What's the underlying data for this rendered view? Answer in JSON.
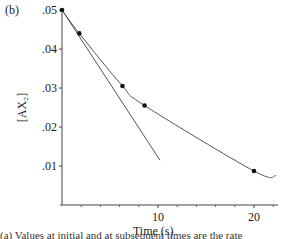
{
  "panel_label": "(b)",
  "bottom_text_fragment": "(a) Values at initial and at subsequent times are the rate",
  "chart_data": {
    "type": "line",
    "title": "",
    "xlabel": "Time (s)",
    "ylabel": "[AX2]",
    "ylabel_display": "[AX₂]",
    "xlim": [
      0,
      22.5
    ],
    "ylim": [
      0,
      0.05
    ],
    "x_ticks": [
      10,
      20
    ],
    "x_tick_labels": [
      "10",
      "20"
    ],
    "x_minor_ticks": [
      2,
      4,
      6,
      8,
      12,
      14,
      16,
      18,
      22
    ],
    "y_ticks": [
      0.01,
      0.02,
      0.03,
      0.04,
      0.05
    ],
    "y_tick_labels": [
      ".01",
      ".02",
      ".03",
      ".04",
      ".05"
    ],
    "grid": false,
    "legend": null,
    "series": [
      {
        "name": "concentration curve",
        "style": "curve",
        "points": [
          {
            "x": 0,
            "y": 0.05
          },
          {
            "x": 1.8,
            "y": 0.044
          },
          {
            "x": 6.3,
            "y": 0.0305
          },
          {
            "x": 8.6,
            "y": 0.0255
          },
          {
            "x": 20,
            "y": 0.0087
          }
        ],
        "curve_end": {
          "x": 22.3,
          "y": 0.0075
        }
      },
      {
        "name": "initial tangent line",
        "style": "straight",
        "points": [
          {
            "x": 0,
            "y": 0.05
          },
          {
            "x": 10.2,
            "y": 0.0115
          }
        ]
      }
    ],
    "colors": {
      "axis": "#444444",
      "curve": "#555555",
      "marker": "#111111"
    }
  }
}
